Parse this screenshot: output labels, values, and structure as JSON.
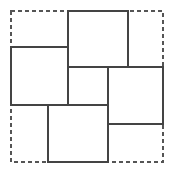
{
  "figure": {
    "canvas": {
      "width": 175,
      "height": 173,
      "background": "#ffffff"
    },
    "colors": {
      "square_stroke": "#444444",
      "boundary_stroke": "#555555",
      "fill": "#ffffff",
      "background": "#ffffff"
    },
    "strokes": {
      "square_width": 1.2,
      "boundary_width": 1.2,
      "boundary_dash": "4 3"
    },
    "boundary": {
      "name": "outer-dashed-square",
      "style": "dashed",
      "x": 11,
      "y": 11,
      "width": 152,
      "height": 151
    },
    "squares": [
      {
        "name": "top-square",
        "label": "top",
        "x": 68,
        "y": 11,
        "width": 60,
        "height": 56
      },
      {
        "name": "left-square",
        "label": "left",
        "x": 11,
        "y": 47,
        "width": 57,
        "height": 58
      },
      {
        "name": "center-square",
        "label": "center",
        "x": 68,
        "y": 67,
        "width": 40,
        "height": 38
      },
      {
        "name": "right-square",
        "label": "right",
        "x": 108,
        "y": 67,
        "width": 55,
        "height": 57
      },
      {
        "name": "bottom-square",
        "label": "bottom",
        "x": 48,
        "y": 105,
        "width": 60,
        "height": 57
      }
    ]
  }
}
